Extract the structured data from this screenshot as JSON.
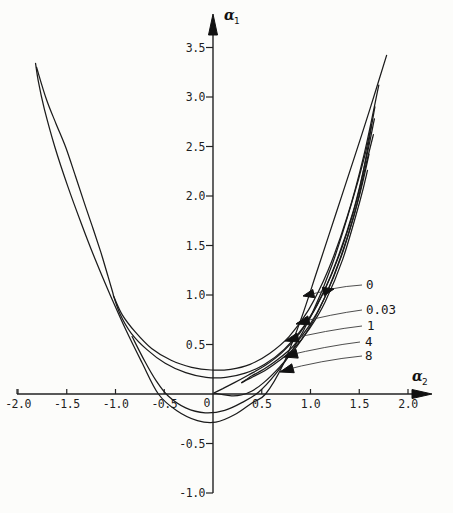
{
  "figure": {
    "background": "#fcfcfa",
    "line_color": "#1b1b1b"
  },
  "chart_data": {
    "type": "line",
    "title": "",
    "xlabel_greek": "α",
    "xlabel_sub": "2",
    "ylabel_greek": "α",
    "ylabel_sub": "1",
    "xlim": [
      -2.25,
      2.3
    ],
    "ylim": [
      -1.2,
      3.85
    ],
    "grid": false,
    "origin_label": "0",
    "x_ticks": [
      {
        "value": -2.0,
        "label": "-2.0"
      },
      {
        "value": -1.5,
        "label": "-1.5"
      },
      {
        "value": -1.0,
        "label": "-1.0"
      },
      {
        "value": -0.5,
        "label": "-0.5"
      },
      {
        "value": 0.5,
        "label": "0.5"
      },
      {
        "value": 1.0,
        "label": "1.0"
      },
      {
        "value": 1.5,
        "label": "1.5"
      },
      {
        "value": 2.0,
        "label": "2.0"
      }
    ],
    "y_ticks": [
      {
        "value": 3.5,
        "label": "3.5"
      },
      {
        "value": 3.0,
        "label": "3.0"
      },
      {
        "value": 2.5,
        "label": "2.5"
      },
      {
        "value": 2.0,
        "label": "2.0"
      },
      {
        "value": 1.5,
        "label": "1.5"
      },
      {
        "value": 1.0,
        "label": "1.0"
      },
      {
        "value": 0.5,
        "label": "0.5"
      },
      {
        "value": -0.5,
        "label": "-0.5"
      },
      {
        "value": -1.0,
        "label": "-1.0"
      }
    ],
    "series": [
      {
        "name": "curve-0-outer",
        "points": [
          [
            -1.82,
            3.34
          ],
          [
            -1.79,
            3.15
          ],
          [
            -1.73,
            2.88
          ],
          [
            -1.62,
            2.49
          ],
          [
            -1.49,
            2.1
          ],
          [
            -1.35,
            1.72
          ],
          [
            -1.2,
            1.34
          ],
          [
            -1.05,
            0.99
          ],
          [
            -0.89,
            0.64
          ],
          [
            -0.73,
            0.32
          ],
          [
            -0.56,
            0.0
          ],
          [
            -0.37,
            -0.17
          ],
          [
            -0.16,
            -0.27
          ],
          [
            0.03,
            -0.285
          ],
          [
            0.22,
            -0.21
          ],
          [
            0.4,
            -0.09
          ],
          [
            0.54,
            0.0
          ],
          [
            0.72,
            0.3
          ],
          [
            0.9,
            0.75
          ],
          [
            1.08,
            1.28
          ],
          [
            1.26,
            1.82
          ],
          [
            1.44,
            2.36
          ],
          [
            1.61,
            2.88
          ],
          [
            1.78,
            3.42
          ]
        ]
      },
      {
        "name": "curve-0-return",
        "points": [
          [
            -1.81,
            3.3
          ],
          [
            -1.71,
            2.98
          ],
          [
            -1.61,
            2.73
          ],
          [
            -1.51,
            2.49
          ],
          [
            -1.41,
            2.2
          ],
          [
            -1.32,
            1.93
          ],
          [
            -1.23,
            1.67
          ],
          [
            -1.15,
            1.43
          ],
          [
            -1.08,
            1.2
          ],
          [
            -1.03,
            1.03
          ],
          [
            -1.02,
            0.99
          ]
        ]
      },
      {
        "name": "curve-003-upper",
        "points": [
          [
            -1.02,
            0.99
          ],
          [
            -0.93,
            0.8
          ],
          [
            -0.8,
            0.63
          ],
          [
            -0.63,
            0.46
          ],
          [
            -0.43,
            0.34
          ],
          [
            -0.22,
            0.27
          ],
          [
            -0.02,
            0.242
          ],
          [
            0.18,
            0.25
          ],
          [
            0.38,
            0.3
          ],
          [
            0.58,
            0.41
          ],
          [
            0.78,
            0.58
          ],
          [
            0.98,
            0.85
          ],
          [
            1.18,
            1.25
          ],
          [
            1.38,
            1.8
          ],
          [
            1.55,
            2.42
          ],
          [
            1.7,
            3.12
          ]
        ]
      },
      {
        "name": "curve-003-lower",
        "points": [
          [
            -1.02,
            0.99
          ],
          [
            -0.95,
            0.8
          ],
          [
            -0.84,
            0.615
          ],
          [
            -0.68,
            0.45
          ],
          [
            -0.49,
            0.31
          ],
          [
            -0.28,
            0.215
          ],
          [
            -0.07,
            0.168
          ],
          [
            0.13,
            0.168
          ],
          [
            0.33,
            0.21
          ],
          [
            0.53,
            0.3
          ],
          [
            0.73,
            0.45
          ],
          [
            0.93,
            0.68
          ],
          [
            1.13,
            1.02
          ],
          [
            1.33,
            1.5
          ],
          [
            1.51,
            2.1
          ],
          [
            1.66,
            2.9
          ]
        ]
      },
      {
        "name": "curve-1-upper",
        "points": [
          [
            0.01,
            0.01
          ],
          [
            0.1,
            0.055
          ],
          [
            0.22,
            0.115
          ],
          [
            0.36,
            0.19
          ],
          [
            0.53,
            0.285
          ],
          [
            0.71,
            0.42
          ],
          [
            0.89,
            0.615
          ],
          [
            1.07,
            0.9
          ],
          [
            1.25,
            1.3
          ],
          [
            1.44,
            1.85
          ],
          [
            1.58,
            2.42
          ],
          [
            1.655,
            2.78
          ]
        ]
      },
      {
        "name": "curve-1-lower",
        "points": [
          [
            0.01,
            0.01
          ],
          [
            0.09,
            -0.005
          ],
          [
            0.19,
            -0.018
          ],
          [
            0.29,
            -0.01
          ],
          [
            0.4,
            0.03
          ],
          [
            0.52,
            0.115
          ],
          [
            0.68,
            0.27
          ],
          [
            0.86,
            0.48
          ],
          [
            1.04,
            0.76
          ],
          [
            1.24,
            1.2
          ],
          [
            1.44,
            1.78
          ],
          [
            1.56,
            2.28
          ],
          [
            1.645,
            2.62
          ]
        ]
      },
      {
        "name": "curve-4-upper",
        "points": [
          [
            0.295,
            0.115
          ],
          [
            0.4,
            0.185
          ],
          [
            0.52,
            0.25
          ],
          [
            0.66,
            0.345
          ],
          [
            0.82,
            0.48
          ],
          [
            0.98,
            0.68
          ],
          [
            1.14,
            0.96
          ],
          [
            1.32,
            1.4
          ],
          [
            1.5,
            2.0
          ],
          [
            1.6,
            2.42
          ]
        ]
      },
      {
        "name": "curve-4-lower",
        "points": [
          [
            0.295,
            0.115
          ],
          [
            0.41,
            0.175
          ],
          [
            0.53,
            0.235
          ],
          [
            0.67,
            0.33
          ],
          [
            0.83,
            0.46
          ],
          [
            0.99,
            0.66
          ],
          [
            1.15,
            0.93
          ],
          [
            1.33,
            1.36
          ],
          [
            1.51,
            1.96
          ],
          [
            1.585,
            2.26
          ]
        ]
      },
      {
        "name": "curve-8",
        "points": [
          [
            -0.83,
            0.58
          ],
          [
            -0.7,
            0.33
          ],
          [
            -0.58,
            0.13
          ],
          [
            -0.46,
            -0.02
          ],
          [
            -0.28,
            -0.14
          ],
          [
            -0.08,
            -0.19
          ],
          [
            0.12,
            -0.165
          ],
          [
            0.3,
            -0.085
          ],
          [
            0.47,
            0.02
          ],
          [
            0.64,
            0.2
          ],
          [
            0.82,
            0.45
          ],
          [
            1.02,
            0.82
          ],
          [
            1.22,
            1.3
          ],
          [
            1.42,
            1.92
          ],
          [
            1.555,
            2.4
          ],
          [
            1.625,
            2.72
          ]
        ]
      }
    ],
    "annotations": [
      {
        "label": "0",
        "double": true,
        "head_left": [
          303,
          296
        ],
        "head_right": [
          334,
          289
        ],
        "leader": [
          [
            331,
            289
          ],
          [
            346,
            286
          ],
          [
            362,
            285
          ]
        ],
        "label_pos": [
          366,
          289
        ]
      },
      {
        "label": "0.03",
        "tip": [
          296,
          324
        ],
        "leader": [
          [
            297,
            323
          ],
          [
            332,
            314
          ],
          [
            362,
            310
          ]
        ],
        "label_pos": [
          366,
          314
        ]
      },
      {
        "label": "1",
        "tip": [
          285,
          341
        ],
        "leader": [
          [
            286,
            340
          ],
          [
            327,
            330
          ],
          [
            362,
            326
          ]
        ],
        "label_pos": [
          367,
          330
        ]
      },
      {
        "label": "4",
        "tip": [
          284,
          357
        ],
        "leader": [
          [
            285,
            356
          ],
          [
            327,
            346
          ],
          [
            360,
            342
          ]
        ],
        "label_pos": [
          365,
          346
        ]
      },
      {
        "label": "8",
        "tip": [
          280,
          372
        ],
        "leader": [
          [
            281,
            371
          ],
          [
            322,
            360
          ],
          [
            362,
            356
          ]
        ],
        "label_pos": [
          365,
          360
        ]
      }
    ]
  }
}
